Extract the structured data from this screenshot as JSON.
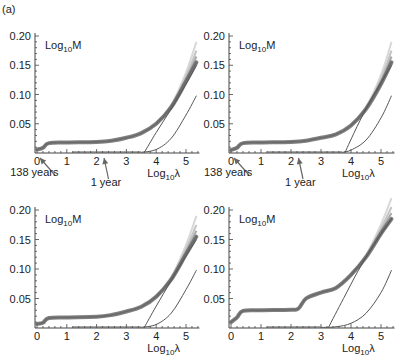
{
  "figure": {
    "panel_label": "(a)",
    "y_label": "Log10M",
    "x_label": "Log10λ",
    "annotations": {
      "arrow_1": "138 years",
      "arrow_2": "1 year"
    }
  },
  "chart_data": [
    {
      "type": "line",
      "panel": "top-left",
      "title": "",
      "ylabel": "Log10M",
      "xlabel": "Log10λ",
      "xlim": [
        0,
        5.4
      ],
      "ylim": [
        0,
        0.21
      ],
      "xticks": [
        0,
        1,
        2,
        3,
        4,
        5
      ],
      "yticks": [
        0.05,
        0.1,
        0.15,
        0.2
      ],
      "annotations": [
        {
          "text": "138 years",
          "x": 0.05
        },
        {
          "text": "1 year",
          "x": 2.2
        }
      ],
      "series": [
        {
          "name": "data band",
          "x": [
            0,
            0.2,
            0.4,
            1,
            2,
            2.5,
            3,
            3.5,
            4,
            4.5,
            5,
            5.35
          ],
          "y": [
            0.006,
            0.009,
            0.017,
            0.018,
            0.019,
            0.021,
            0.026,
            0.034,
            0.05,
            0.078,
            0.122,
            0.155
          ]
        },
        {
          "name": "linear asymptote",
          "x": [
            3.6,
            4.0,
            4.5,
            5.0,
            5.35
          ],
          "y": [
            0.001,
            0.035,
            0.075,
            0.118,
            0.15
          ]
        },
        {
          "name": "reference curve",
          "x": [
            3.5,
            4.0,
            4.5,
            5.0,
            5.35
          ],
          "y": [
            0.001,
            0.006,
            0.025,
            0.065,
            0.098
          ]
        }
      ]
    },
    {
      "type": "line",
      "panel": "top-right",
      "title": "",
      "ylabel": "Log10M",
      "xlabel": "Log10λ",
      "xlim": [
        0,
        5.4
      ],
      "ylim": [
        0,
        0.21
      ],
      "xticks": [
        0,
        1,
        2,
        3,
        4,
        5
      ],
      "yticks": [
        0.05,
        0.1,
        0.15,
        0.2
      ],
      "annotations": [
        {
          "text": "138 years",
          "x": 0.05
        },
        {
          "text": "1 year",
          "x": 2.2
        }
      ],
      "series": [
        {
          "name": "data band",
          "x": [
            0,
            0.2,
            0.4,
            1,
            2,
            2.5,
            3,
            3.5,
            4,
            4.5,
            5,
            5.35
          ],
          "y": [
            0.005,
            0.009,
            0.017,
            0.018,
            0.019,
            0.021,
            0.026,
            0.032,
            0.047,
            0.075,
            0.118,
            0.155
          ]
        },
        {
          "name": "linear asymptote",
          "x": [
            3.8,
            4.2,
            4.6,
            5.0,
            5.35
          ],
          "y": [
            0.001,
            0.045,
            0.085,
            0.12,
            0.15
          ]
        },
        {
          "name": "reference curve",
          "x": [
            3.7,
            4.0,
            4.5,
            5.0,
            5.35
          ],
          "y": [
            0.001,
            0.005,
            0.022,
            0.06,
            0.098
          ]
        }
      ]
    },
    {
      "type": "line",
      "panel": "bottom-left",
      "title": "",
      "ylabel": "Log10M",
      "xlabel": "Log10λ",
      "xlim": [
        0,
        5.4
      ],
      "ylim": [
        0,
        0.21
      ],
      "xticks": [
        0,
        1,
        2,
        3,
        4,
        5
      ],
      "yticks": [
        0.05,
        0.1,
        0.15,
        0.2
      ],
      "series": [
        {
          "name": "data band",
          "x": [
            0,
            0.2,
            0.4,
            1,
            2,
            2.5,
            3,
            3.5,
            4,
            4.5,
            5,
            5.35
          ],
          "y": [
            0.007,
            0.009,
            0.017,
            0.018,
            0.019,
            0.022,
            0.028,
            0.036,
            0.053,
            0.082,
            0.125,
            0.155
          ]
        },
        {
          "name": "linear asymptote",
          "x": [
            3.6,
            4.0,
            4.5,
            5.0,
            5.35
          ],
          "y": [
            0.001,
            0.037,
            0.08,
            0.122,
            0.15
          ]
        },
        {
          "name": "reference curve",
          "x": [
            3.5,
            4.0,
            4.5,
            5.0,
            5.35
          ],
          "y": [
            0.001,
            0.006,
            0.025,
            0.065,
            0.098
          ]
        }
      ]
    },
    {
      "type": "line",
      "panel": "bottom-right",
      "title": "",
      "ylabel": "Log10M",
      "xlabel": "Log10λ",
      "xlim": [
        0,
        5.4
      ],
      "ylim": [
        0,
        0.21
      ],
      "xticks": [
        0,
        1,
        2,
        3,
        4,
        5
      ],
      "yticks": [
        0.05,
        0.1,
        0.15,
        0.2
      ],
      "series": [
        {
          "name": "data band",
          "x": [
            0,
            0.2,
            0.4,
            1,
            2,
            2.25,
            2.5,
            3,
            3.5,
            4,
            4.5,
            5,
            5.35
          ],
          "y": [
            0.01,
            0.018,
            0.029,
            0.03,
            0.031,
            0.033,
            0.05,
            0.06,
            0.068,
            0.09,
            0.12,
            0.16,
            0.185
          ]
        },
        {
          "name": "linear asymptote",
          "x": [
            3.25,
            3.75,
            4.25,
            4.75,
            5.35
          ],
          "y": [
            0.001,
            0.05,
            0.098,
            0.14,
            0.185
          ]
        },
        {
          "name": "reference curve",
          "x": [
            3.0,
            3.5,
            4.0,
            4.5,
            5.0,
            5.35
          ],
          "y": [
            0.001,
            0.002,
            0.008,
            0.025,
            0.06,
            0.098
          ]
        }
      ]
    }
  ]
}
